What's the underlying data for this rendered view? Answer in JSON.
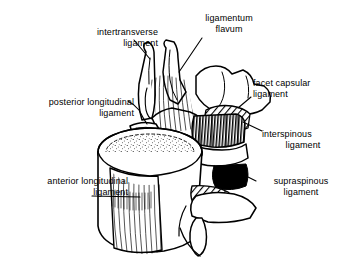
{
  "figure": {
    "background_color": "#ffffff",
    "ink_color": "#000000"
  },
  "labels": [
    {
      "id": "intertransverse",
      "name": "intertransverse-ligament-label",
      "line1": "intertransverse",
      "line2": "ligament",
      "align": "right"
    },
    {
      "id": "ligamentum_flavum",
      "name": "ligamentum-flavum-label",
      "line1": "ligamentum",
      "line2": "flavum",
      "align": "center"
    },
    {
      "id": "posterior_longitudinal",
      "name": "posterior-longitudinal-ligament-label",
      "line1": "posterior longitudinal",
      "line2": "ligament",
      "align": "right"
    },
    {
      "id": "facet_capsular",
      "name": "facet-capsular-ligament-label",
      "line1": "facet capsular",
      "line2": "ligament",
      "align": "left"
    },
    {
      "id": "interspinous",
      "name": "interspinous-ligament-label",
      "line1": "interspinous",
      "line2": "ligament",
      "align": "left"
    },
    {
      "id": "anterior_longitudinal",
      "name": "anterior-longitudinal-ligament-label",
      "line1": "anterior longitudinal",
      "line2": "ligament",
      "align": "right"
    },
    {
      "id": "supraspinous",
      "name": "supraspinous-ligament-label",
      "line1": "supraspinous",
      "line2": "ligament",
      "align": "center"
    }
  ],
  "anatomy": {
    "vertebral_body": "upper vertebral body with stippled superior endplate",
    "anterior_longitudinal_fibers": "vertical striated fiber band on anterior body surface",
    "ligamentum_flavum_fibers": "fanning vertical fibers between laminae",
    "interspinous_shading": "dense vertical hatching",
    "supraspinous_shading": "solid black wedge",
    "facet_shading": "diagonal hatching"
  }
}
